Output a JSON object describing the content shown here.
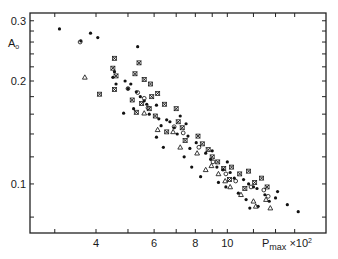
{
  "chart_data": {
    "type": "scatter",
    "title": "",
    "xlabel": "P_max ×10²",
    "ylabel": "A₀",
    "xscale": "log",
    "yscale": "log",
    "xlim": [
      2.7,
      17.2
    ],
    "ylim": [
      0.072,
      0.316
    ],
    "grid": false,
    "legend": null,
    "x_ticks": [
      {
        "value": 3,
        "label": ""
      },
      {
        "value": 4,
        "label": "4"
      },
      {
        "value": 5,
        "label": ""
      },
      {
        "value": 6,
        "label": "6"
      },
      {
        "value": 7,
        "label": ""
      },
      {
        "value": 8,
        "label": "8"
      },
      {
        "value": 9,
        "label": ""
      },
      {
        "value": 10,
        "label": "10"
      },
      {
        "value": 12,
        "label": ""
      },
      {
        "value": 14,
        "label": ""
      },
      {
        "value": 16,
        "label": ""
      }
    ],
    "y_ticks": [
      {
        "value": 0.08,
        "label": ""
      },
      {
        "value": 0.1,
        "label": "0.1"
      },
      {
        "value": 0.12,
        "label": ""
      },
      {
        "value": 0.14,
        "label": ""
      },
      {
        "value": 0.16,
        "label": ""
      },
      {
        "value": 0.18,
        "label": ""
      },
      {
        "value": 0.2,
        "label": "0.2"
      },
      {
        "value": 0.22,
        "label": ""
      },
      {
        "value": 0.24,
        "label": ""
      },
      {
        "value": 0.26,
        "label": ""
      },
      {
        "value": 0.28,
        "label": ""
      },
      {
        "value": 0.3,
        "label": "0.3"
      }
    ],
    "series": [
      {
        "name": "dots",
        "marker": "dot",
        "points": [
          [
            3.1,
            0.284
          ],
          [
            3.85,
            0.276
          ],
          [
            3.6,
            0.262
          ],
          [
            4.05,
            0.268
          ],
          [
            5.35,
            0.252
          ],
          [
            4.5,
            0.205
          ],
          [
            4.55,
            0.213
          ],
          [
            4.9,
            0.2
          ],
          [
            5.1,
            0.196
          ],
          [
            4.6,
            0.196
          ],
          [
            5.0,
            0.19
          ],
          [
            5.3,
            0.186
          ],
          [
            5.45,
            0.18
          ],
          [
            5.6,
            0.175
          ],
          [
            5.7,
            0.171
          ],
          [
            6.1,
            0.17
          ],
          [
            5.2,
            0.166
          ],
          [
            4.85,
            0.161
          ],
          [
            5.8,
            0.16
          ],
          [
            6.2,
            0.155
          ],
          [
            6.55,
            0.154
          ],
          [
            6.7,
            0.152
          ],
          [
            6.3,
            0.148
          ],
          [
            6.9,
            0.146
          ],
          [
            7.2,
            0.158
          ],
          [
            7.5,
            0.15
          ],
          [
            7.05,
            0.14
          ],
          [
            7.6,
            0.138
          ],
          [
            8.05,
            0.132
          ],
          [
            6.1,
            0.137
          ],
          [
            6.4,
            0.128
          ],
          [
            7.7,
            0.127
          ],
          [
            8.6,
            0.123
          ],
          [
            8.9,
            0.118
          ],
          [
            7.4,
            0.12
          ],
          [
            9.3,
            0.112
          ],
          [
            9.7,
            0.11
          ],
          [
            10.2,
            0.108
          ],
          [
            10.5,
            0.104
          ],
          [
            11.2,
            0.103
          ],
          [
            11.6,
            0.1
          ],
          [
            12.0,
            0.098
          ],
          [
            12.3,
            0.097
          ],
          [
            9.4,
            0.101
          ],
          [
            9.9,
            0.098
          ],
          [
            10.8,
            0.094
          ],
          [
            11.4,
            0.09
          ],
          [
            13.0,
            0.093
          ],
          [
            13.4,
            0.089
          ],
          [
            14.0,
            0.091
          ],
          [
            15.2,
            0.087
          ],
          [
            16.4,
            0.083
          ],
          [
            12.4,
            0.086
          ],
          [
            11.7,
            0.085
          ],
          [
            14.2,
            0.095
          ],
          [
            8.3,
            0.105
          ],
          [
            7.8,
            0.112
          ],
          [
            9.0,
            0.125
          ],
          [
            10.0,
            0.116
          ]
        ]
      },
      {
        "name": "crosses",
        "marker": "x",
        "points": [
          [
            4.55,
            0.233
          ],
          [
            4.5,
            0.218
          ],
          [
            4.6,
            0.207
          ],
          [
            4.55,
            0.189
          ],
          [
            5.4,
            0.226
          ],
          [
            4.1,
            0.183
          ],
          [
            5.25,
            0.21
          ],
          [
            5.6,
            0.202
          ],
          [
            5.85,
            0.196
          ],
          [
            5.15,
            0.176
          ],
          [
            5.5,
            0.172
          ],
          [
            5.9,
            0.18
          ],
          [
            5.3,
            0.162
          ],
          [
            5.8,
            0.166
          ],
          [
            6.15,
            0.184
          ],
          [
            6.45,
            0.171
          ],
          [
            6.05,
            0.158
          ],
          [
            6.55,
            0.142
          ],
          [
            7.0,
            0.166
          ],
          [
            7.1,
            0.152
          ],
          [
            7.3,
            0.146
          ],
          [
            7.45,
            0.134
          ],
          [
            8.15,
            0.138
          ],
          [
            8.4,
            0.131
          ],
          [
            8.75,
            0.126
          ],
          [
            9.0,
            0.12
          ],
          [
            9.35,
            0.116
          ],
          [
            9.75,
            0.111
          ],
          [
            10.3,
            0.112
          ],
          [
            10.9,
            0.107
          ],
          [
            11.6,
            0.109
          ],
          [
            10.15,
            0.103
          ],
          [
            12.1,
            0.101
          ],
          [
            12.7,
            0.104
          ],
          [
            11.3,
            0.097
          ],
          [
            13.2,
            0.098
          ]
        ]
      },
      {
        "name": "open-circles",
        "marker": "circle",
        "points": [
          [
            3.58,
            0.26
          ],
          [
            5.0,
            0.19
          ],
          [
            5.35,
            0.185
          ],
          [
            5.6,
            0.178
          ],
          [
            5.75,
            0.167
          ],
          [
            6.9,
            0.147
          ],
          [
            7.35,
            0.141
          ],
          [
            8.2,
            0.128
          ],
          [
            9.05,
            0.116
          ],
          [
            9.9,
            0.107
          ],
          [
            10.6,
            0.102
          ],
          [
            11.8,
            0.098
          ],
          [
            12.9,
            0.096
          ],
          [
            13.3,
            0.092
          ]
        ]
      },
      {
        "name": "triangles",
        "marker": "triangle",
        "points": [
          [
            3.7,
            0.205
          ],
          [
            5.6,
            0.161
          ],
          [
            6.15,
            0.144
          ],
          [
            6.85,
            0.142
          ],
          [
            7.2,
            0.128
          ],
          [
            8.1,
            0.123
          ],
          [
            8.6,
            0.11
          ],
          [
            9.4,
            0.107
          ],
          [
            9.85,
            0.102
          ],
          [
            10.2,
            0.098
          ],
          [
            11.0,
            0.093
          ],
          [
            12.0,
            0.089
          ],
          [
            12.2,
            0.086
          ],
          [
            13.1,
            0.09
          ],
          [
            13.5,
            0.085
          ],
          [
            8.95,
            0.113
          ]
        ]
      }
    ]
  }
}
